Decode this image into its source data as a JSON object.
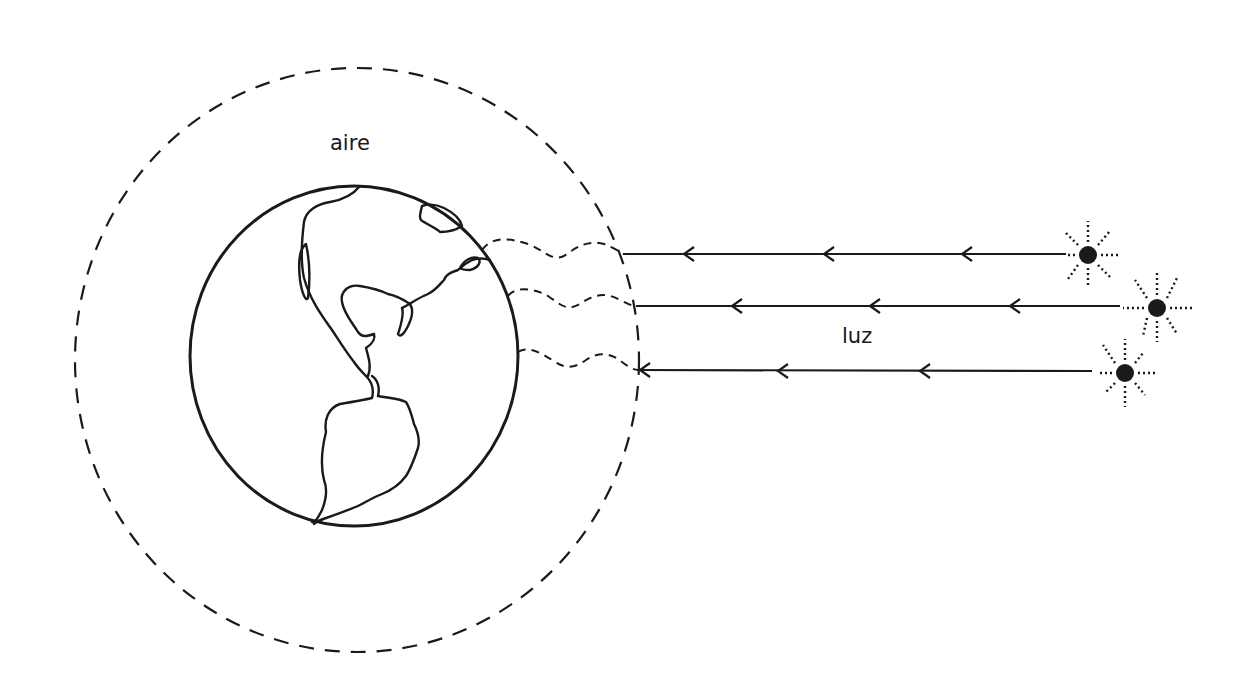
{
  "diagram": {
    "labels": {
      "atmosphere": "aire",
      "light": "luz"
    },
    "colors": {
      "stroke": "#1a1a1a",
      "background": "#ffffff"
    },
    "elements": {
      "atmosphere_circle": {
        "style": "dashed"
      },
      "earth": {
        "depicts": "Americas",
        "style": "outline"
      },
      "light_rays": 3,
      "suns": 3
    }
  }
}
